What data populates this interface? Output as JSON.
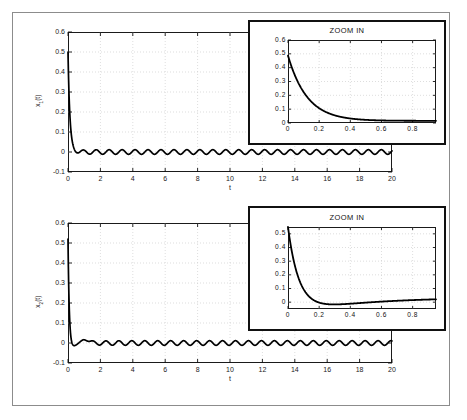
{
  "figure": {
    "background": "#ffffff",
    "frame_color": "#8c8c8c",
    "line_color": "#000000",
    "grid_color": "#bbbbbb"
  },
  "panels": [
    {
      "name": "top-panel",
      "ylabel_main": "x",
      "ylabel_sub": "1",
      "ylabel_tail": "(t)",
      "xlabel": "t",
      "yticks": [
        "0.6",
        "0.5",
        "0.4",
        "0.3",
        "0.2",
        "0.1",
        "0",
        "-0.1"
      ],
      "ytick_values": [
        0.6,
        0.5,
        0.4,
        0.3,
        0.2,
        0.1,
        0,
        -0.1
      ],
      "xticks": [
        "0",
        "2",
        "4",
        "6",
        "8",
        "10",
        "12",
        "14",
        "16",
        "18",
        "20"
      ],
      "xtick_values": [
        0,
        2,
        4,
        6,
        8,
        10,
        12,
        14,
        16,
        18,
        20
      ],
      "inset": {
        "title": "ZOOM IN",
        "yticks": [
          "0.6",
          "0.5",
          "0.4",
          "0.3",
          "0.2",
          "0.1",
          "0"
        ],
        "ytick_values": [
          0.6,
          0.5,
          0.4,
          0.3,
          0.2,
          0.1,
          0
        ],
        "xticks": [
          "0",
          "0.2",
          "0.4",
          "0.6",
          "0.8"
        ],
        "xtick_values": [
          0,
          0.2,
          0.4,
          0.6,
          0.8
        ]
      }
    },
    {
      "name": "bottom-panel",
      "ylabel_main": "x",
      "ylabel_sub": "2",
      "ylabel_tail": "(t)",
      "xlabel": "t",
      "yticks": [
        "0.6",
        "0.5",
        "0.4",
        "0.3",
        "0.2",
        "0.1",
        "0",
        "-0.1"
      ],
      "ytick_values": [
        0.6,
        0.5,
        0.4,
        0.3,
        0.2,
        0.1,
        0,
        -0.1
      ],
      "xticks": [
        "0",
        "2",
        "4",
        "6",
        "8",
        "10",
        "12",
        "14",
        "16",
        "18",
        "20"
      ],
      "xtick_values": [
        0,
        2,
        4,
        6,
        8,
        10,
        12,
        14,
        16,
        18,
        20
      ],
      "inset": {
        "title": "ZOOM IN",
        "yticks": [
          "0.5",
          "0.4",
          "0.3",
          "0.2",
          "0.1",
          "0"
        ],
        "ytick_values": [
          0.5,
          0.4,
          0.3,
          0.2,
          0.1,
          0
        ],
        "xticks": [
          "0",
          "0.2",
          "0.4",
          "0.6",
          "0.8"
        ],
        "xtick_values": [
          0,
          0.2,
          0.4,
          0.6,
          0.8
        ]
      }
    }
  ],
  "chart_data": [
    {
      "type": "line",
      "name": "x1-main",
      "title": "",
      "xlabel": "t",
      "ylabel": "x_1(t)",
      "xlim": [
        0,
        20
      ],
      "ylim": [
        -0.1,
        0.6
      ],
      "grid": true,
      "description": "State x1(t) starts at 0.5, decays sharply to near zero by t=0.7, then shows a small steady sinusoidal ripple of amplitude about 0.012 around zero for the rest of the 20 second window.",
      "series": [
        {
          "name": "x1",
          "initial_value": 0.5,
          "decay_time_constant": 0.12,
          "settle_offset": 0.0,
          "ripple_amplitude": 0.012,
          "ripple_period": 0.8,
          "ripple_start_time": 0.7,
          "sample_points_t": [
            0,
            0.05,
            0.1,
            0.15,
            0.2,
            0.3,
            0.4,
            0.5,
            0.7,
            1.0,
            2.0,
            5.0,
            10.0,
            15.0,
            20.0
          ],
          "sample_points_y": [
            0.5,
            0.34,
            0.23,
            0.16,
            0.11,
            0.055,
            0.03,
            0.02,
            0.012,
            -0.008,
            0.009,
            -0.01,
            0.008,
            -0.009,
            0.004
          ]
        }
      ]
    },
    {
      "type": "line",
      "name": "x1-inset",
      "title": "ZOOM IN",
      "xlabel": "",
      "ylabel": "",
      "xlim": [
        0,
        0.95
      ],
      "ylim": [
        0,
        0.6
      ],
      "grid": true,
      "description": "Zoomed view of x1(t) over the first second: exponential decay from 0.5 down to a flat value near 0.015.",
      "series": [
        {
          "name": "x1-zoom",
          "sample_points_t": [
            0,
            0.05,
            0.1,
            0.15,
            0.2,
            0.25,
            0.3,
            0.35,
            0.4,
            0.5,
            0.6,
            0.7,
            0.8,
            0.9,
            0.95
          ],
          "sample_points_y": [
            0.5,
            0.335,
            0.225,
            0.155,
            0.105,
            0.075,
            0.055,
            0.042,
            0.033,
            0.025,
            0.02,
            0.017,
            0.016,
            0.016,
            0.017
          ]
        }
      ]
    },
    {
      "type": "line",
      "name": "x2-main",
      "title": "",
      "xlabel": "t",
      "ylabel": "x_2(t)",
      "xlim": [
        0,
        20
      ],
      "ylim": [
        -0.1,
        0.6
      ],
      "grid": true,
      "description": "State x2(t) starts at 0.5, drops rapidly and undershoots slightly below zero near t=0.2, recovers with a small bump near t=1, then settles into a steady sinusoidal ripple of amplitude about 0.012 around zero.",
      "series": [
        {
          "name": "x2",
          "initial_value": 0.5,
          "undershoot_value": -0.016,
          "undershoot_time": 0.2,
          "bump_value": 0.022,
          "bump_time": 1.0,
          "ripple_amplitude": 0.012,
          "ripple_period": 0.8,
          "ripple_start_time": 1.5,
          "sample_points_t": [
            0,
            0.05,
            0.1,
            0.15,
            0.2,
            0.3,
            0.5,
            0.7,
            0.9,
            1.0,
            1.2,
            1.5,
            2.0,
            5.0,
            10.0,
            15.0,
            20.0
          ],
          "sample_points_y": [
            0.5,
            0.29,
            0.14,
            0.04,
            -0.016,
            -0.014,
            0.005,
            0.016,
            0.021,
            0.022,
            0.012,
            0.0,
            0.009,
            -0.01,
            0.008,
            -0.009,
            0.004
          ]
        }
      ]
    },
    {
      "type": "line",
      "name": "x2-inset",
      "title": "ZOOM IN",
      "xlabel": "",
      "ylabel": "",
      "xlim": [
        0,
        0.95
      ],
      "ylim": [
        -0.05,
        0.55
      ],
      "grid": true,
      "description": "Zoomed view of x2(t) over the first second: steep decay from 0.5, dipping just below zero around t=0.2, then slowly rising back to a flat value near 0.035.",
      "series": [
        {
          "name": "x2-zoom",
          "sample_points_t": [
            0,
            0.04,
            0.08,
            0.12,
            0.16,
            0.2,
            0.25,
            0.3,
            0.35,
            0.4,
            0.5,
            0.6,
            0.7,
            0.8,
            0.9,
            0.95
          ],
          "sample_points_y": [
            0.52,
            0.32,
            0.18,
            0.09,
            0.025,
            -0.012,
            -0.018,
            -0.013,
            -0.005,
            0.003,
            0.015,
            0.023,
            0.028,
            0.031,
            0.033,
            0.034
          ]
        }
      ]
    }
  ]
}
